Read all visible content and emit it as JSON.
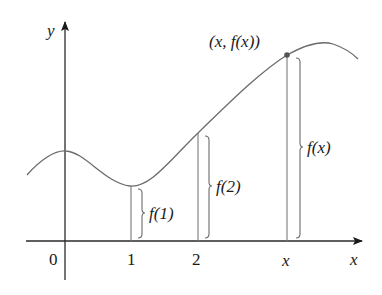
{
  "diagram": {
    "axes": {
      "x_label": "x",
      "y_label": "y",
      "origin_label": "0"
    },
    "ticks": [
      {
        "label": "1"
      },
      {
        "label": "2"
      },
      {
        "label": "x"
      }
    ],
    "point_label": "(x, f(x))",
    "brace_labels": [
      {
        "label": "f(1)"
      },
      {
        "label": "f(2)"
      },
      {
        "label": "f(x)"
      }
    ],
    "colors": {
      "axis": "#1a1a1a",
      "curve": "#6b6b6b",
      "lines": "#7a7a7a",
      "point": "#555555"
    }
  }
}
